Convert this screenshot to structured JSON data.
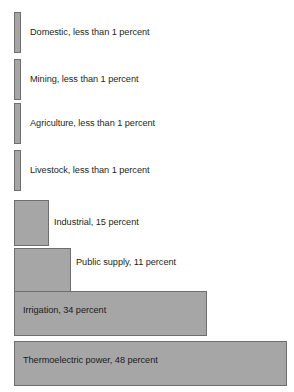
{
  "chart_data": {
    "type": "bar",
    "orientation": "horizontal",
    "title": "",
    "subtitle": "",
    "xlabel": "",
    "ylabel": "",
    "grid": false,
    "legend": false,
    "units": "percent",
    "xlim": [
      0,
      48
    ],
    "categories": [
      "Domestic",
      "Mining",
      "Agriculture",
      "Livestock",
      "Industrial",
      "Public supply",
      "Irrigation",
      "Thermoelectric power"
    ],
    "values": [
      0.5,
      0.5,
      0.5,
      0.5,
      15,
      11,
      34,
      48
    ],
    "value_text": [
      "less than 1 percent",
      "less than 1 percent",
      "less than 1 percent",
      "less than 1 percent",
      "15 percent",
      "11 percent",
      "34 percent",
      "48 percent"
    ],
    "data_labels": [
      "Domestic, less than 1 percent",
      "Mining, less than 1 percent",
      "Agriculture, less than 1 percent",
      "Livestock, less than 1 percent",
      "Industrial, 15 percent",
      "Public supply, 11 percent",
      "Irrigation, 34 percent",
      "Thermoelectric power, 48 percent"
    ],
    "colors": {
      "bar_fill": "#a6a6a6",
      "bar_stroke": "#6e6e6e",
      "label_text": "#231f20",
      "background": "#ffffff"
    }
  },
  "bars": [
    {
      "label": "Domestic, less than 1 percent",
      "top": 12,
      "height": 41,
      "width": 7,
      "label_x": 30,
      "label_y": 28,
      "inside": false
    },
    {
      "label": "Mining, less than 1 percent",
      "top": 59,
      "height": 41,
      "width": 7,
      "label_x": 30,
      "label_y": 75,
      "inside": false
    },
    {
      "label": "Agriculture, less than 1 percent",
      "top": 103,
      "height": 41,
      "width": 7,
      "label_x": 30,
      "label_y": 119,
      "inside": false
    },
    {
      "label": "Livestock, less than 1 percent",
      "top": 150,
      "height": 41,
      "width": 7,
      "label_x": 30,
      "label_y": 166,
      "inside": false
    },
    {
      "label": "Industrial, 15 percent",
      "top": 200,
      "height": 46,
      "width": 35,
      "label_x": 54,
      "label_y": 218,
      "inside": false
    },
    {
      "label": "Public supply, 11 percent",
      "top": 248,
      "height": 45,
      "width": 57,
      "label_x": 76,
      "label_y": 258,
      "inside": false
    },
    {
      "label": "Irrigation, 34 percent",
      "top": 291,
      "height": 45,
      "width": 193,
      "label_x": 23,
      "label_y": 306,
      "inside": true
    },
    {
      "label": "Thermoelectric power, 48 percent",
      "top": 341,
      "height": 45,
      "width": 273,
      "label_x": 23,
      "label_y": 356,
      "inside": true
    }
  ]
}
